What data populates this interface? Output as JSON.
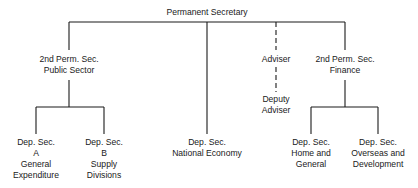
{
  "chart": {
    "type": "org-chart",
    "root": {
      "id": "permanent-secretary",
      "lines": [
        "Permanent Secretary"
      ]
    },
    "second_level": [
      {
        "id": "second-perm-sec-public-sector",
        "lines": [
          "2nd Perm. Sec.",
          "Public Sector"
        ]
      },
      {
        "id": "dep-sec-national-economy",
        "lines": [
          "Dep. Sec.",
          "National Economy"
        ]
      },
      {
        "id": "adviser",
        "lines": [
          "Adviser"
        ],
        "link": "dashed"
      },
      {
        "id": "second-perm-sec-finance",
        "lines": [
          "2nd Perm. Sec.",
          "Finance"
        ]
      }
    ],
    "adviser_sub": {
      "id": "deputy-adviser",
      "lines": [
        "Deputy",
        "Adviser"
      ],
      "link": "dashed"
    },
    "public_sector_children": [
      {
        "id": "dep-sec-a",
        "lines": [
          "Dep. Sec.",
          "A",
          "General",
          "Expenditure"
        ]
      },
      {
        "id": "dep-sec-b",
        "lines": [
          "Dep. Sec.",
          "B",
          "Supply",
          "Divisions"
        ]
      }
    ],
    "finance_children": [
      {
        "id": "dep-sec-home-general",
        "lines": [
          "Dep. Sec.",
          "Home and",
          "General"
        ]
      },
      {
        "id": "dep-sec-overseas-development",
        "lines": [
          "Dep. Sec.",
          "Overseas and",
          "Development"
        ]
      }
    ]
  },
  "colors": {
    "line": "#1a1a1a",
    "text": "#1a1a1a",
    "background": "#ffffff"
  }
}
